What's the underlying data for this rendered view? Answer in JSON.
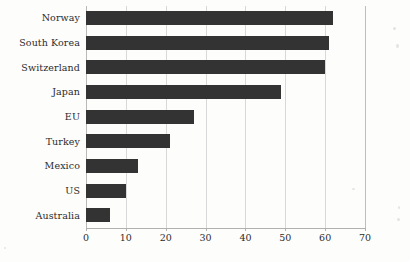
{
  "chart_data": {
    "type": "bar",
    "orientation": "horizontal",
    "title": "",
    "subtitle": "",
    "xlabel": "",
    "ylabel": "",
    "categories": [
      "Norway",
      "South Korea",
      "Switzerland",
      "Japan",
      "EU",
      "Turkey",
      "Mexico",
      "US",
      "Australia"
    ],
    "values": [
      62,
      61,
      60,
      49,
      27,
      21,
      13,
      10,
      6
    ],
    "xlim": [
      0,
      70
    ],
    "xticks": [
      0,
      10,
      20,
      30,
      40,
      50,
      60,
      70
    ],
    "xtick_labels": [
      "0",
      "10",
      "20",
      "30",
      "40",
      "50",
      "60",
      "70"
    ],
    "grid": "vertical",
    "legend": "none",
    "bar_color": "#333333",
    "grid_color": "#d8d8d8",
    "axis_color": "#b0b0b0",
    "background_color": "#fdfdfc",
    "text_color": "#2b2b2b"
  }
}
